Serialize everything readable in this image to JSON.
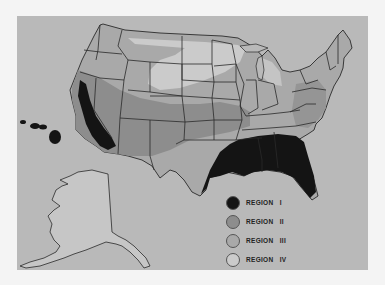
{
  "map": {
    "subject": "United States regional zones map",
    "colors": {
      "background": "#b9b9b9",
      "region_i": "#141414",
      "region_ii": "#8d8d8d",
      "region_iii": "#a9a9a9",
      "region_iv": "#cbcbcb",
      "border": "#2a2a2a"
    },
    "insets": [
      "Alaska",
      "Hawaii"
    ]
  },
  "legend": {
    "items": [
      {
        "label": "REGION   I",
        "color": "#141414"
      },
      {
        "label": "REGION   II",
        "color": "#8d8d8d"
      },
      {
        "label": "REGION   III",
        "color": "#a9a9a9"
      },
      {
        "label": "REGION   IV",
        "color": "#cbcbcb"
      }
    ]
  }
}
